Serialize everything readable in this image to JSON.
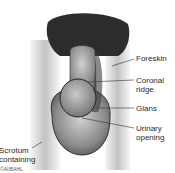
{
  "diagram": {
    "type": "anatomical-illustration",
    "style": "pencil-sketch-greyscale",
    "colors": {
      "ink": "#1a1a1a",
      "shade_dark": "#3a3a3a",
      "shade_mid": "#8a8a8a",
      "shade_light": "#c9c9c9",
      "background": "#ffffff",
      "label_text": "#2a2a2a"
    },
    "labels": [
      {
        "id": "foreskin",
        "text": "Foreskin",
        "lines": [
          "Foreskin"
        ]
      },
      {
        "id": "coronal-ridge",
        "text": "Coronal ridge",
        "lines": [
          "Coronal",
          "ridge"
        ]
      },
      {
        "id": "glans",
        "text": "Glans",
        "lines": [
          "Glans"
        ]
      },
      {
        "id": "urinary-opening",
        "text": "Urinary opening",
        "lines": [
          "Urinary",
          "opening"
        ]
      },
      {
        "id": "scrotum",
        "text": "Scrotum containing testes",
        "lines": [
          "Scrotum",
          "containing",
          "testes"
        ]
      }
    ],
    "credit": "©AI/BAHL"
  }
}
